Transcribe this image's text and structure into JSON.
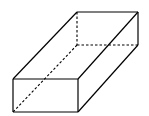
{
  "diagram": {
    "type": "cuboid",
    "stroke_color": "#000000",
    "background": "#ffffff",
    "visible_edges": [
      [
        13,
        79,
        78,
        79
      ],
      [
        78,
        79,
        78,
        112
      ],
      [
        78,
        112,
        13,
        112
      ],
      [
        13,
        112,
        13,
        79
      ],
      [
        13,
        79,
        77,
        12
      ],
      [
        78,
        79,
        138,
        12
      ],
      [
        77,
        12,
        138,
        12
      ],
      [
        78,
        112,
        138,
        45
      ],
      [
        138,
        12,
        138,
        45
      ]
    ],
    "hidden_edges": [
      [
        77,
        12,
        77,
        45
      ],
      [
        77,
        45,
        138,
        45
      ],
      [
        77,
        45,
        13,
        112
      ]
    ]
  }
}
